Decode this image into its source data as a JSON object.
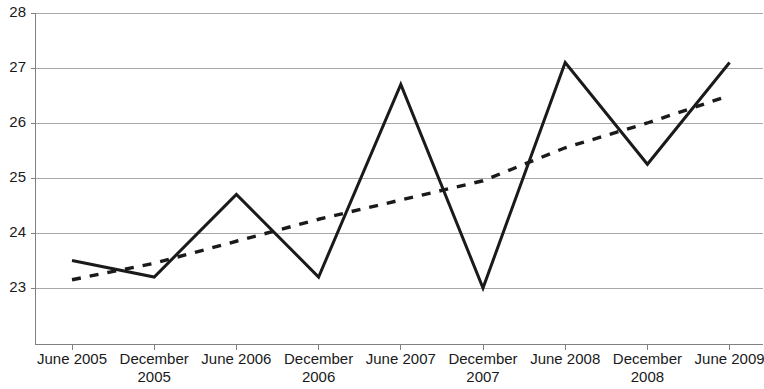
{
  "chart_data": {
    "type": "line",
    "title": "",
    "subtitle": "",
    "xlabel": "",
    "ylabel": "",
    "ylim": [
      21.96,
      28
    ],
    "yticks": [
      23,
      24,
      25,
      26,
      27,
      28
    ],
    "ytick_labels": [
      "23",
      "24",
      "25",
      "26",
      "27",
      "28"
    ],
    "grid": true,
    "legend": "none",
    "categories": [
      "June 2005",
      "December 2005",
      "June 2006",
      "December 2006",
      "June 2007",
      "December 2007",
      "June 2008",
      "December 2008",
      "June 2009"
    ],
    "category_lines": [
      [
        "June 2005"
      ],
      [
        "December",
        "2005"
      ],
      [
        "June 2006"
      ],
      [
        "December",
        "2006"
      ],
      [
        "June 2007"
      ],
      [
        "December",
        "2007"
      ],
      [
        "June 2008"
      ],
      [
        "December",
        "2008"
      ],
      [
        "June 2009"
      ]
    ],
    "series": [
      {
        "name": "data",
        "style": "solid",
        "color": "#1a1a1a",
        "values": [
          23.5,
          23.2,
          24.7,
          23.2,
          26.7,
          23.0,
          27.1,
          25.25,
          27.1
        ]
      },
      {
        "name": "trend",
        "style": "dotted",
        "color": "#1a1a1a",
        "values": [
          23.15,
          23.45,
          23.85,
          24.25,
          24.6,
          24.95,
          25.55,
          26.0,
          26.5
        ]
      }
    ]
  },
  "axis": {
    "y_min_label": "23",
    "y_max_label": "28"
  }
}
